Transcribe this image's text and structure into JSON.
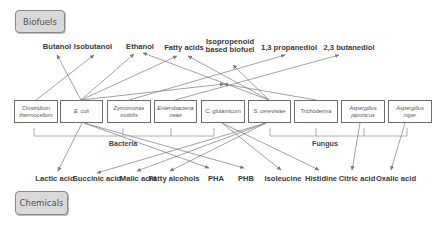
{
  "categories": {
    "biofuels": "Biofuels",
    "chemicals": "Chemicals"
  },
  "biofuels": [
    {
      "id": "butanol",
      "label": "Butanol",
      "x": 57,
      "y": 43
    },
    {
      "id": "isobutanol",
      "label": "Isobutanol",
      "x": 93,
      "y": 43
    },
    {
      "id": "ethanol",
      "label": "Ethanol",
      "x": 140,
      "y": 43
    },
    {
      "id": "fatty_acids",
      "label": "Fatty acids",
      "x": 184,
      "y": 44
    },
    {
      "id": "isopropenoid",
      "label": "Isopropenoid\nbased biofuel",
      "x": 230,
      "y": 38
    },
    {
      "id": "propanediol",
      "label": "1,3 propanediol",
      "x": 289,
      "y": 44
    },
    {
      "id": "butanediol",
      "label": "2,3 butanediol",
      "x": 349,
      "y": 44
    }
  ],
  "organisms": [
    {
      "id": "clostridium",
      "label": "Clostridium\nthermocellum",
      "x": 14,
      "w": 44,
      "italic": true
    },
    {
      "id": "ecoli",
      "label": "E. coli",
      "x": 60,
      "w": 43,
      "italic": true
    },
    {
      "id": "zymomonas",
      "label": "Zymomonas\nmobilis",
      "x": 107,
      "w": 44,
      "italic": true
    },
    {
      "id": "enterobacteriaceae",
      "label": "Enterobacteria\nceae",
      "x": 154,
      "w": 43,
      "italic": true
    },
    {
      "id": "cglutamicum",
      "label": "C. glutamicum",
      "x": 201,
      "w": 44,
      "italic": false
    },
    {
      "id": "scerevisiae",
      "label": "S. cerevisiae",
      "x": 248,
      "w": 43,
      "italic": false
    },
    {
      "id": "trichoderma",
      "label": "Trichoderma",
      "x": 294,
      "w": 44,
      "italic": false
    },
    {
      "id": "ajaponicus",
      "label": "Aspergillus\njaponicus",
      "x": 341,
      "w": 44,
      "italic": true
    },
    {
      "id": "aniger",
      "label": "Aspergillus\nniger",
      "x": 388,
      "w": 44,
      "italic": true
    }
  ],
  "groups": [
    {
      "id": "bacteria",
      "label": "Bacteria",
      "x1": 34,
      "x2": 214,
      "ticks": [
        34,
        123,
        171,
        214
      ],
      "label_x": 123
    },
    {
      "id": "fungus",
      "label": "Fungus",
      "x1": 270,
      "x2": 407,
      "ticks": [
        270,
        316,
        364,
        407
      ],
      "label_x": 325
    }
  ],
  "chemicals": [
    {
      "id": "lactic",
      "label": "Lactic acid",
      "x": 55
    },
    {
      "id": "succinic",
      "label": "Succinic acid",
      "x": 97
    },
    {
      "id": "malic",
      "label": "Malic acid",
      "x": 138
    },
    {
      "id": "fatty_alcohols",
      "label": "Fatty alcohols",
      "x": 174
    },
    {
      "id": "pha",
      "label": "PHA",
      "x": 216
    },
    {
      "id": "phb",
      "label": "PHB",
      "x": 246
    },
    {
      "id": "isoleucine",
      "label": "Isoleucine",
      "x": 283
    },
    {
      "id": "histidine",
      "label": "Histidine",
      "x": 321
    },
    {
      "id": "citric",
      "label": "Citric acid",
      "x": 357
    },
    {
      "id": "oxalic",
      "label": "Oxalic acid",
      "x": 396
    }
  ],
  "arrows_up": [
    {
      "from": "clostridium",
      "fx": 36,
      "fy": 100,
      "tx": 94,
      "ty": 55
    },
    {
      "from": "ecoli",
      "fx": 81,
      "fy": 100,
      "tx": 57,
      "ty": 55
    },
    {
      "from": "ecoli",
      "fx": 81,
      "fy": 100,
      "tx": 134,
      "ty": 54
    },
    {
      "from": "ecoli",
      "fx": 81,
      "fy": 100,
      "tx": 177,
      "ty": 56
    },
    {
      "from": "ecoli",
      "fx": 81,
      "fy": 100,
      "tx": 224,
      "ty": 84
    },
    {
      "from": "zymomonas",
      "fx": 129,
      "fy": 100,
      "tx": 285,
      "ty": 55
    },
    {
      "from": "enterobacteriaceae",
      "fx": 175,
      "fy": 100,
      "tx": 339,
      "ty": 55
    },
    {
      "from": "scerevisiae",
      "fx": 269,
      "fy": 100,
      "tx": 143,
      "ty": 53
    },
    {
      "from": "scerevisiae",
      "fx": 269,
      "fy": 100,
      "tx": 188,
      "ty": 56
    },
    {
      "from": "scerevisiae",
      "fx": 269,
      "fy": 100,
      "tx": 233,
      "ty": 65
    },
    {
      "from": "trichoderma",
      "fx": 316,
      "fy": 100,
      "tx": 224,
      "ty": 84
    }
  ],
  "arrows_down": [
    {
      "from": "ecoli",
      "fx": 82,
      "fy": 123,
      "tx": 58,
      "ty": 171
    },
    {
      "from": "ecoli",
      "fx": 84,
      "fy": 123,
      "tx": 209,
      "ty": 168
    },
    {
      "from": "ecoli",
      "fx": 84,
      "fy": 123,
      "tx": 244,
      "ty": 168
    },
    {
      "from": "scerevisiae",
      "fx": 266,
      "fy": 123,
      "tx": 97,
      "ty": 173
    },
    {
      "from": "scerevisiae",
      "fx": 266,
      "fy": 123,
      "tx": 137,
      "ty": 171
    },
    {
      "from": "scerevisiae",
      "fx": 266,
      "fy": 123,
      "tx": 170,
      "ty": 171
    },
    {
      "from": "cglutamicum",
      "fx": 222,
      "fy": 123,
      "tx": 281,
      "ty": 170
    },
    {
      "from": "cglutamicum",
      "fx": 222,
      "fy": 123,
      "tx": 319,
      "ty": 170
    },
    {
      "from": "ajaponicus",
      "fx": 360,
      "fy": 123,
      "tx": 352,
      "ty": 170
    },
    {
      "from": "aniger",
      "fx": 405,
      "fy": 123,
      "tx": 391,
      "ty": 170
    }
  ],
  "colors": {
    "category_fill": "#d9d9d9",
    "line": "#7a7a7a",
    "text": "#3a3a3a"
  }
}
